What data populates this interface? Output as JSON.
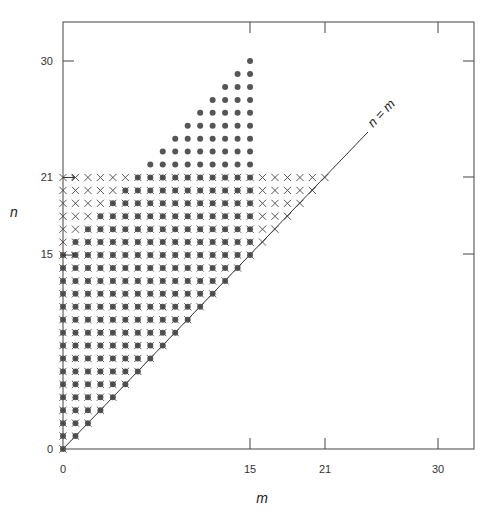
{
  "chart_data": {
    "type": "scatter",
    "title": "",
    "xlabel": "m",
    "ylabel": "n",
    "xlim": [
      0,
      33
    ],
    "ylim": [
      0,
      33
    ],
    "grid": false,
    "x_ticks": [
      0,
      15,
      21,
      30
    ],
    "y_ticks": [
      0,
      15,
      21,
      30
    ],
    "x_tick_labels": [
      "0",
      "15",
      "21",
      "30"
    ],
    "y_tick_labels": [
      "0",
      "15",
      "21",
      "30"
    ],
    "annotations": [
      {
        "text": "n = m",
        "type": "line",
        "from": [
          0,
          0
        ],
        "to": [
          23,
          23
        ],
        "label_pos": [
          24.5,
          24.5
        ]
      }
    ],
    "arrows": [
      {
        "from": [
          0,
          21
        ],
        "to": [
          1,
          21
        ]
      },
      {
        "from": [
          0,
          15
        ],
        "to": [
          1,
          15
        ]
      }
    ],
    "series": [
      {
        "name": "cross",
        "marker": "x",
        "color": "#444444",
        "rule": "all integer (m, n) with 0 <= m <= n <= 21"
      },
      {
        "name": "dot",
        "marker": "o",
        "color": "#555555",
        "rule": "integer (m, n) with m <= 15, m <= n, and (n <= 15) or (15 < n <= 21 and m >= 21 - n) or (22 <= n <= 30 and m >= n - 15)"
      }
    ],
    "dot_rows_upper": [
      {
        "n": 22,
        "m_from": 7,
        "m_to": 15
      },
      {
        "n": 23,
        "m_from": 8,
        "m_to": 15
      },
      {
        "n": 24,
        "m_from": 9,
        "m_to": 15
      },
      {
        "n": 25,
        "m_from": 10,
        "m_to": 15
      },
      {
        "n": 26,
        "m_from": 11,
        "m_to": 15
      },
      {
        "n": 27,
        "m_from": 12,
        "m_to": 15
      },
      {
        "n": 28,
        "m_from": 13,
        "m_to": 15
      },
      {
        "n": 29,
        "m_from": 14,
        "m_to": 15
      },
      {
        "n": 30,
        "m_from": 15,
        "m_to": 15
      }
    ],
    "dot_rows_band": [
      {
        "n": 21,
        "m_from": 6,
        "m_to": 15
      },
      {
        "n": 20,
        "m_from": 5,
        "m_to": 15
      },
      {
        "n": 19,
        "m_from": 4,
        "m_to": 15
      },
      {
        "n": 18,
        "m_from": 3,
        "m_to": 15
      },
      {
        "n": 17,
        "m_from": 2,
        "m_to": 15
      },
      {
        "n": 16,
        "m_from": 1,
        "m_to": 15
      }
    ],
    "dot_rows_lower": "for n = 0..15: m = 0..n"
  },
  "labels": {
    "xlabel": "m",
    "ylabel": "n",
    "diag": "n = m",
    "xt0": "0",
    "xt15": "15",
    "xt21": "21",
    "xt30": "30",
    "yt0": "0",
    "yt15": "15",
    "yt21": "21",
    "yt30": "30"
  }
}
